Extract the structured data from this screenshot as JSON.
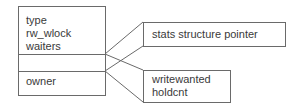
{
  "diagram": {
    "left_struct": {
      "section1": [
        "type",
        "rw_wlock",
        "waiters"
      ],
      "section2": [],
      "section3": [
        "owner"
      ]
    },
    "stats_box": {
      "label": "stats structure pointer"
    },
    "owner_box": {
      "lines": [
        "writewanted",
        "holdcnt"
      ]
    }
  },
  "colors": {
    "border": "#6a6a6a",
    "text": "#3a3a3a",
    "background": "#ffffff"
  }
}
